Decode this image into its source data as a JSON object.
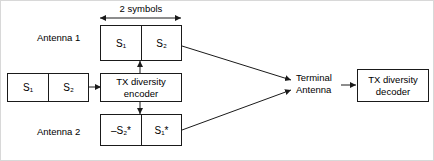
{
  "diagram": {
    "dimension": {
      "label": "2 symbols"
    },
    "labels": {
      "antenna_1": "Antenna 1",
      "antenna_2": "Antenna 2",
      "terminal_antenna_line1": "Terminal",
      "terminal_antenna_line2": "Antenna"
    },
    "blocks": {
      "input_stream": {
        "cell_1": "S₁",
        "cell_2": "S₂"
      },
      "encoder": {
        "line1": "TX diversity",
        "line2": "encoder"
      },
      "antenna_1_stream": {
        "cell_1": "S₁",
        "cell_2": "S₂"
      },
      "antenna_2_stream": {
        "cell_1": "–S₂*",
        "cell_2": "S₁*"
      },
      "decoder": {
        "line1": "TX diversity",
        "line2": "decoder"
      }
    },
    "colors": {
      "stroke": "#1a1a1a",
      "background": "#ffffff",
      "text": "#000000"
    }
  }
}
